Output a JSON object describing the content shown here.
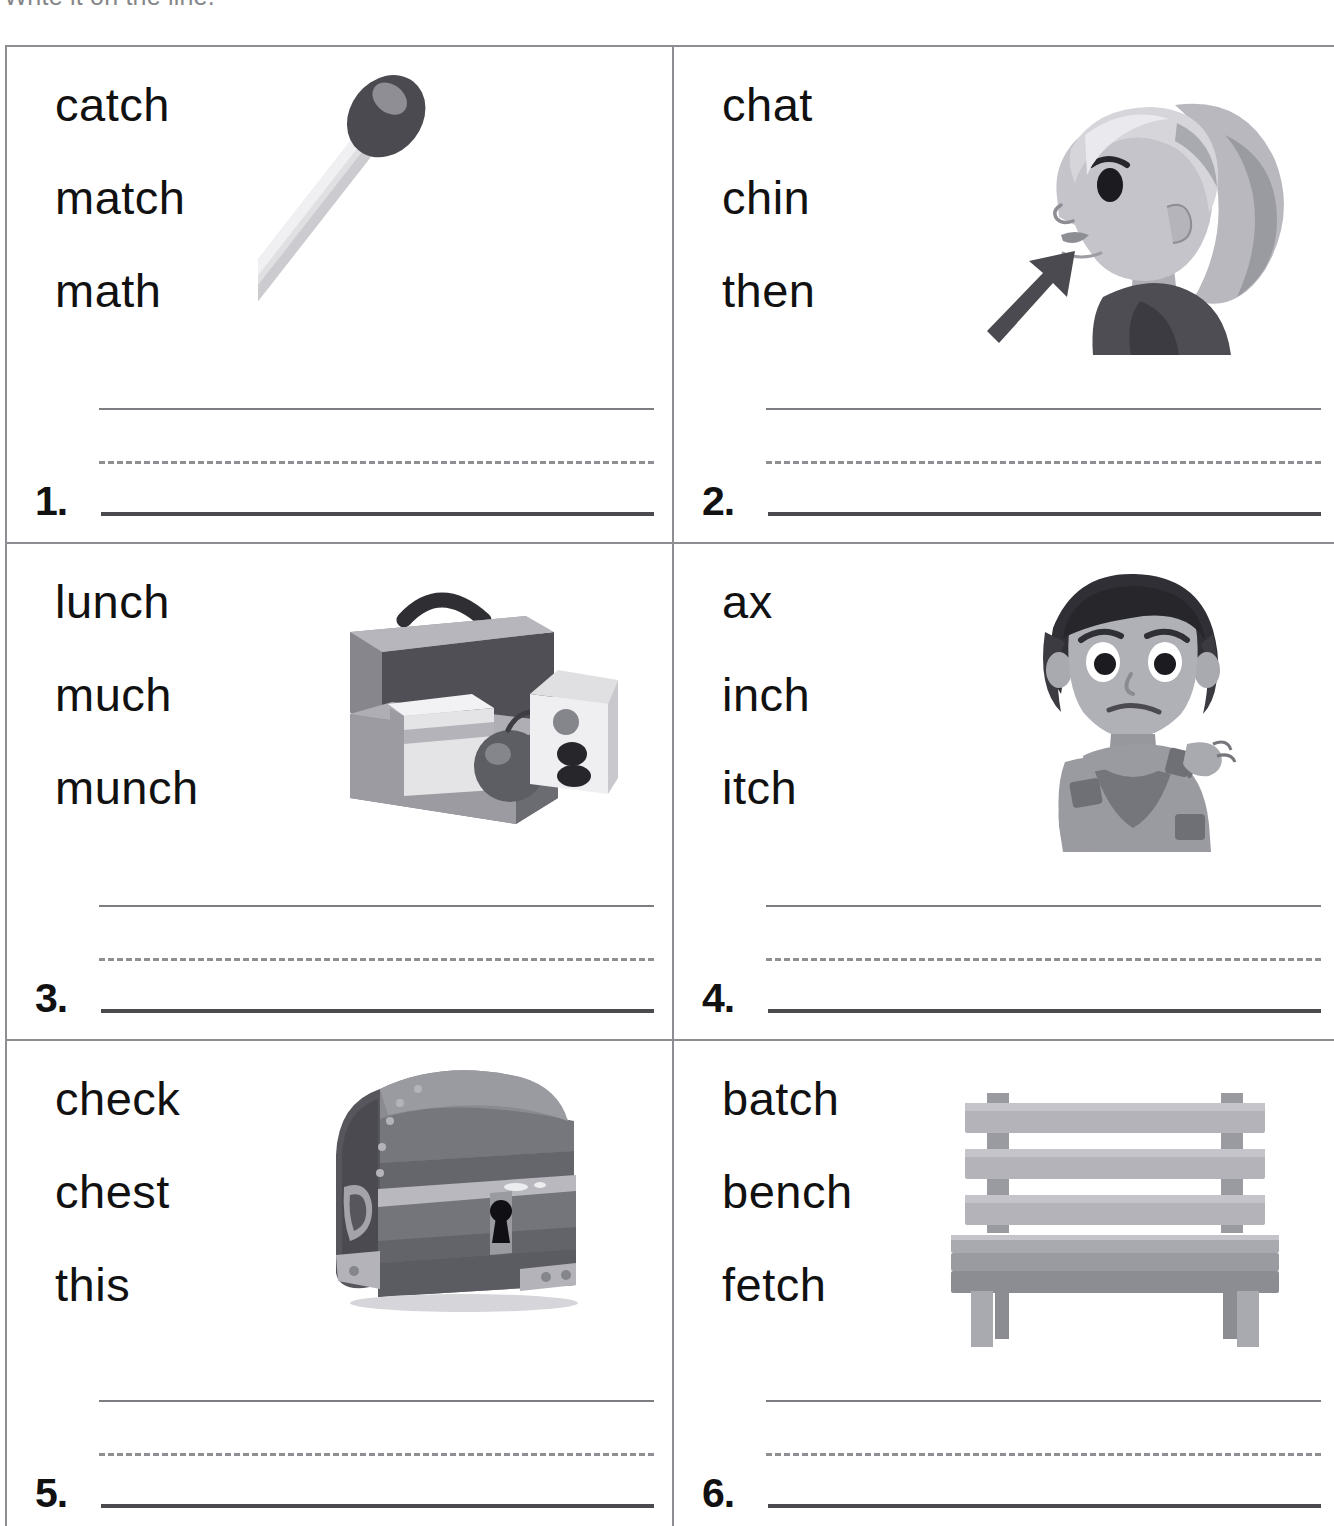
{
  "instruction": "Write it on the line.",
  "worksheet": {
    "columns": 2,
    "rows": 3,
    "cells": [
      {
        "number": "1.",
        "words": [
          "catch",
          "match",
          "math"
        ],
        "picture": "match-icon",
        "picture_label": "matchstick"
      },
      {
        "number": "2.",
        "words": [
          "chat",
          "chin",
          "then"
        ],
        "picture": "girl-profile-chin-icon",
        "picture_label": "girl profile with arrow pointing to chin"
      },
      {
        "number": "3.",
        "words": [
          "lunch",
          "much",
          "munch"
        ],
        "picture": "lunchbox-icon",
        "picture_label": "open lunchbox with sandwich, apple and milk carton"
      },
      {
        "number": "4.",
        "words": [
          "ax",
          "inch",
          "itch"
        ],
        "picture": "girl-scratching-icon",
        "picture_label": "girl scratching her shoulder"
      },
      {
        "number": "5.",
        "words": [
          "check",
          "chest",
          "this"
        ],
        "picture": "treasure-chest-icon",
        "picture_label": "treasure chest with keyhole"
      },
      {
        "number": "6.",
        "words": [
          "batch",
          "bench",
          "fetch"
        ],
        "picture": "bench-icon",
        "picture_label": "wooden park bench"
      }
    ]
  },
  "colors": {
    "grid_line": "#8d8d92",
    "guide_top_line": "#7d7d82",
    "guide_dashed_line": "#8e8e93",
    "answer_line": "#4a4a4f",
    "text": "#111111",
    "art_dark": "#3f3f44",
    "art_mid": "#8a8a90",
    "art_light": "#c9c9cd",
    "art_pale": "#e4e4e7"
  }
}
